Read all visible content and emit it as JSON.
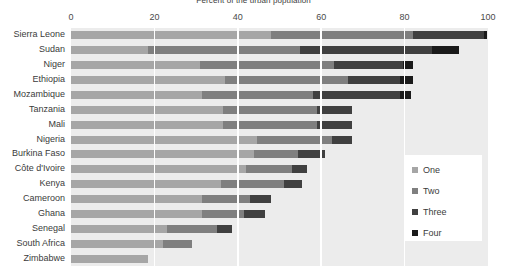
{
  "chart_data": {
    "type": "bar",
    "orientation": "horizontal",
    "stacked": true,
    "title": "Percent of the urban population",
    "xlabel": "",
    "ylabel": "",
    "xlim": [
      0,
      100
    ],
    "xticks": [
      0,
      20,
      40,
      60,
      80,
      100
    ],
    "xtick_labels": [
      "0",
      "20",
      "40",
      "60",
      "80",
      "100"
    ],
    "grid": true,
    "grid_axis": "x",
    "legend_position": "right",
    "categories": [
      "Sierra Leone",
      "Sudan",
      "Niger",
      "Ethiopia",
      "Mozambique",
      "Tanzania",
      "Mali",
      "Nigeria",
      "Burkina Faso",
      "Côte d'Ivoire",
      "Kenya",
      "Cameroon",
      "Ghana",
      "Senegal",
      "South Africa",
      "Zimbabwe"
    ],
    "series": [
      {
        "name": "One",
        "color": "#a6a6a6",
        "values": [
          48.0,
          18.5,
          31.0,
          37.0,
          31.5,
          36.5,
          36.5,
          44.5,
          44.0,
          42.0,
          36.0,
          31.5,
          31.5,
          23.0,
          22.0,
          18.5
        ]
      },
      {
        "name": "Two",
        "color": "#7f7f7f",
        "values": [
          34.0,
          36.5,
          32.0,
          29.5,
          26.5,
          22.5,
          22.5,
          18.0,
          10.5,
          11.0,
          15.0,
          11.5,
          10.0,
          12.0,
          7.0,
          0.0
        ]
      },
      {
        "name": "Three",
        "color": "#404040",
        "values": [
          17.0,
          31.5,
          16.5,
          12.5,
          21.0,
          8.5,
          8.5,
          5.0,
          6.5,
          3.5,
          4.5,
          5.0,
          5.0,
          3.5,
          0.0,
          0.0
        ]
      },
      {
        "name": "Four",
        "color": "#1a1a1a",
        "values": [
          0.8,
          6.5,
          2.5,
          3.0,
          2.5,
          0.0,
          0.0,
          0.0,
          0.0,
          0.0,
          0.0,
          0.0,
          0.0,
          0.0,
          0.0,
          0.0
        ]
      }
    ],
    "totals": [
      99.8,
      93.0,
      82.0,
      82.0,
      81.5,
      67.5,
      67.5,
      67.5,
      61.0,
      56.5,
      55.5,
      48.0,
      46.5,
      38.5,
      29.0,
      18.5
    ]
  },
  "legend": {
    "items": [
      {
        "label": "One",
        "color": "#a6a6a6"
      },
      {
        "label": "Two",
        "color": "#7f7f7f"
      },
      {
        "label": "Three",
        "color": "#404040"
      },
      {
        "label": "Four",
        "color": "#1a1a1a"
      }
    ]
  },
  "colors": {
    "plot_background": "#ececec",
    "gridline": "#ffffff",
    "text": "#3b3b3b",
    "page_background": "#ffffff"
  }
}
